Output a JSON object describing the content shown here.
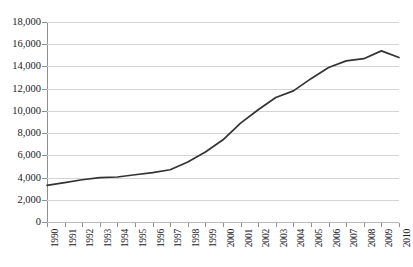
{
  "figure": {
    "title_clipped": "",
    "background_color": "#ffffff"
  },
  "chart_data": {
    "type": "line",
    "title": "",
    "xlabel": "",
    "ylabel": "",
    "grid": true,
    "legend": false,
    "line_color": "#333333",
    "gridline_color": "#d4d4d4",
    "axis_color": "#8f8f8f",
    "ylim": [
      0,
      18000
    ],
    "ytick_step": 2000,
    "ytick_labels": [
      "18,000",
      "16,000",
      "14,000",
      "12,000",
      "10,000",
      "8,000",
      "6,000",
      "4,000",
      "2,000",
      "0"
    ],
    "ytick_values": [
      18000,
      16000,
      14000,
      12000,
      10000,
      8000,
      6000,
      4000,
      2000,
      0
    ],
    "categories": [
      "1990",
      "1991",
      "1992",
      "1993",
      "1994",
      "1995",
      "1996",
      "1997",
      "1998",
      "1999",
      "2000",
      "2001",
      "2002",
      "2003",
      "2004",
      "2005",
      "2006",
      "2007",
      "2008",
      "2009",
      "2010"
    ],
    "x": [
      1990,
      1991,
      1992,
      1993,
      1994,
      1995,
      1996,
      1997,
      1998,
      1999,
      2000,
      2001,
      2002,
      2003,
      2004,
      2005,
      2006,
      2007,
      2008,
      2009,
      2010
    ],
    "values": [
      3300,
      3550,
      3800,
      4000,
      4050,
      4250,
      4450,
      4700,
      5400,
      6300,
      7400,
      8900,
      10100,
      11200,
      11800,
      12900,
      13900,
      14500,
      14700,
      15400,
      14800
    ]
  }
}
